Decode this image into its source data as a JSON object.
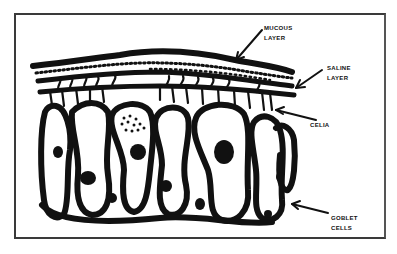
{
  "diagram": {
    "type": "illustration",
    "style": "black ink line drawing on white",
    "colors": {
      "ink": "#111111",
      "background": "#ffffff",
      "frame": "#3a3a3a"
    },
    "labels": {
      "mucous": {
        "line1": "Mucous",
        "line2": "Layer"
      },
      "saline": {
        "line1": "Saline",
        "line2": "Layer"
      },
      "celia": {
        "line1": "Celia"
      },
      "goblet": {
        "line1": "Goblet",
        "line2": "Cells"
      }
    }
  }
}
